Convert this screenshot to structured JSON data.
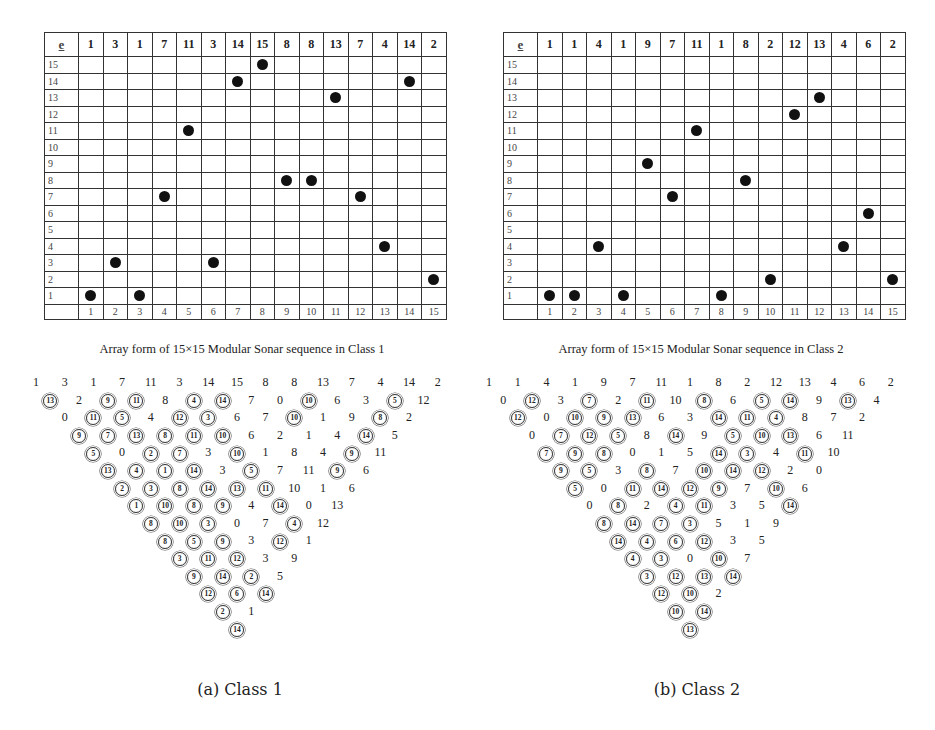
{
  "panels": [
    {
      "id": "class1",
      "header_label": "e",
      "header_values": [
        "1",
        "3",
        "1",
        "7",
        "11",
        "3",
        "14",
        "15",
        "8",
        "8",
        "13",
        "7",
        "4",
        "14",
        "2"
      ],
      "row_labels": [
        "15",
        "14",
        "13",
        "12",
        "11",
        "10",
        "9",
        "8",
        "7",
        "6",
        "5",
        "4",
        "3",
        "2",
        "1"
      ],
      "column_labels": [
        "1",
        "2",
        "3",
        "4",
        "5",
        "6",
        "7",
        "8",
        "9",
        "10",
        "11",
        "12",
        "13",
        "14",
        "15"
      ],
      "dots": [
        1,
        3,
        1,
        7,
        11,
        3,
        14,
        15,
        8,
        8,
        13,
        7,
        4,
        14,
        2
      ],
      "caption": "Array form of  15×15 Modular Sonar sequence in Class 1",
      "triangle": [
        [
          "1",
          "3",
          "1",
          "7",
          "11",
          "3",
          "14",
          "15",
          "8",
          "8",
          "13",
          "7",
          "4",
          "14",
          "2"
        ],
        [
          "c13",
          "2",
          "c9",
          "c11",
          "8",
          "c4",
          "c14",
          "7",
          "0",
          "c10",
          "6",
          "3",
          "c5",
          "12"
        ],
        [
          "0",
          "c11",
          "c5",
          "4",
          "c12",
          "c3",
          "6",
          "7",
          "c10",
          "1",
          "9",
          "c8",
          "2"
        ],
        [
          "c9",
          "c7",
          "c13",
          "c8",
          "c11",
          "c10",
          "6",
          "2",
          "1",
          "4",
          "c14",
          "5"
        ],
        [
          "c5",
          "0",
          "c2",
          "c7",
          "3",
          "c10",
          "1",
          "8",
          "4",
          "c9",
          "11"
        ],
        [
          "c13",
          "c4",
          "c1",
          "c14",
          "3",
          "c5",
          "7",
          "11",
          "c9",
          "6"
        ],
        [
          "c2",
          "c3",
          "c8",
          "c14",
          "c13",
          "c11",
          "10",
          "1",
          "6"
        ],
        [
          "c1",
          "c10",
          "c8",
          "c9",
          "4",
          "c14",
          "0",
          "13"
        ],
        [
          "c8",
          "c10",
          "c3",
          "0",
          "7",
          "c4",
          "12"
        ],
        [
          "c8",
          "c5",
          "c9",
          "3",
          "c12",
          "1"
        ],
        [
          "c3",
          "c11",
          "c12",
          "3",
          "9"
        ],
        [
          "c9",
          "c14",
          "c2",
          "5"
        ],
        [
          "c12",
          "c6",
          "c14"
        ],
        [
          "c2",
          "1"
        ],
        [
          "c14"
        ]
      ],
      "sublabel": "(a) Class 1"
    },
    {
      "id": "class2",
      "header_label": "e",
      "header_values": [
        "1",
        "1",
        "4",
        "1",
        "9",
        "7",
        "11",
        "1",
        "8",
        "2",
        "12",
        "13",
        "4",
        "6",
        "2"
      ],
      "row_labels": [
        "15",
        "14",
        "13",
        "12",
        "11",
        "10",
        "9",
        "8",
        "7",
        "6",
        "5",
        "4",
        "3",
        "2",
        "1"
      ],
      "column_labels": [
        "1",
        "2",
        "3",
        "4",
        "5",
        "6",
        "7",
        "8",
        "9",
        "10",
        "11",
        "12",
        "13",
        "14",
        "15"
      ],
      "dots": [
        1,
        1,
        4,
        1,
        9,
        7,
        11,
        1,
        8,
        2,
        12,
        13,
        4,
        6,
        2
      ],
      "caption": "Array form of  15×15 Modular Sonar sequence in Class 2",
      "triangle": [
        [
          "1",
          "1",
          "4",
          "1",
          "9",
          "7",
          "11",
          "1",
          "8",
          "2",
          "12",
          "13",
          "4",
          "6",
          "2"
        ],
        [
          "0",
          "c12",
          "3",
          "c7",
          "2",
          "c11",
          "10",
          "c8",
          "6",
          "c5",
          "c14",
          "9",
          "c13",
          "4"
        ],
        [
          "c12",
          "0",
          "c10",
          "c9",
          "c13",
          "6",
          "3",
          "c14",
          "c11",
          "c4",
          "8",
          "7",
          "2"
        ],
        [
          "0",
          "c7",
          "c12",
          "c5",
          "8",
          "c14",
          "9",
          "c5",
          "c10",
          "c13",
          "6",
          "11"
        ],
        [
          "c7",
          "c9",
          "c8",
          "0",
          "1",
          "5",
          "c14",
          "c3",
          "4",
          "c11",
          "10"
        ],
        [
          "c9",
          "c5",
          "3",
          "c8",
          "7",
          "c10",
          "c14",
          "c12",
          "2",
          "0"
        ],
        [
          "c5",
          "0",
          "c11",
          "c14",
          "c12",
          "c9",
          "7",
          "c10",
          "6"
        ],
        [
          "0",
          "c8",
          "2",
          "c4",
          "c11",
          "3",
          "5",
          "c14"
        ],
        [
          "c8",
          "c14",
          "c7",
          "c3",
          "5",
          "1",
          "9"
        ],
        [
          "c14",
          "c4",
          "c6",
          "c12",
          "3",
          "5"
        ],
        [
          "c4",
          "c3",
          "0",
          "c10",
          "7"
        ],
        [
          "c3",
          "c12",
          "c13",
          "c14"
        ],
        [
          "c12",
          "c10",
          "2"
        ],
        [
          "c10",
          "c14"
        ],
        [
          "c13"
        ]
      ],
      "sublabel": "(b) Class 2"
    }
  ]
}
